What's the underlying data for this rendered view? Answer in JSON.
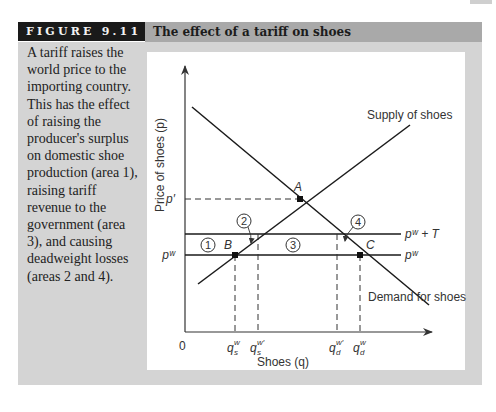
{
  "figure": {
    "label": "FIGURE 9.11",
    "title": "The effect of a tariff on shoes",
    "caption": "A tariff raises the world price to the importing country. This has the effect of raising the producer's surplus on domestic shoe production (area 1), raising tariff revenue to the government (area 3), and causing deadweight losses (areas 2 and 4)."
  },
  "diagram": {
    "y_axis_label": "Price of shoes (p)",
    "x_axis_label": "Shoes (q)",
    "origin_label": "0",
    "curves": {
      "supply": "Supply of shoes",
      "demand": "Demand for shoes"
    },
    "price_lines": {
      "p_prime": "p′",
      "pw": "pʷ",
      "pw_plus_t": "pʷ + T"
    },
    "points": {
      "A": "A",
      "B": "B",
      "C": "C"
    },
    "areas": [
      "1",
      "2",
      "3",
      "4"
    ],
    "quantities": {
      "qs_w": "q",
      "qs_w_sub": "s",
      "qs_w_sup": "w",
      "qs_w_prime_sup": "w′",
      "qd_w_sub": "d",
      "qd_w_sup": "w",
      "qd_w_prime_sup": "w′"
    },
    "colors": {
      "background_panel": "#d4d4d4",
      "header_black": "#1a1a1a",
      "header_gray": "#a9a9a9",
      "line": "#1a1a1a"
    }
  }
}
